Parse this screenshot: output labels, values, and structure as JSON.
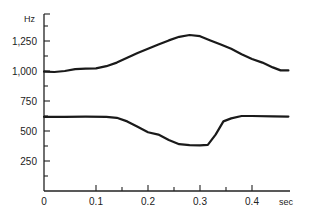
{
  "chart_data": {
    "type": "line",
    "title": "",
    "xlabel": "sec",
    "ylabel": "Hz",
    "xlim": [
      0,
      0.47
    ],
    "ylim": [
      0,
      1450
    ],
    "grid": false,
    "legend": "none",
    "x_ticks": [
      {
        "value": 0,
        "label": "0"
      },
      {
        "value": 0.1,
        "label": "0.1"
      },
      {
        "value": 0.2,
        "label": "0.2"
      },
      {
        "value": 0.3,
        "label": "0.3"
      },
      {
        "value": 0.4,
        "label": "0.4"
      }
    ],
    "x_minor_ticks": [
      0.15,
      0.25,
      0.35
    ],
    "y_ticks": [
      {
        "value": 250,
        "label": "250"
      },
      {
        "value": 500,
        "label": "500"
      },
      {
        "value": 750,
        "label": "750"
      },
      {
        "value": 1000,
        "label": "1,000"
      },
      {
        "value": 1250,
        "label": "1,250"
      }
    ],
    "y_minor_ticks": [
      125,
      375,
      625,
      875,
      1125,
      1375
    ],
    "series": [
      {
        "name": "upper formant",
        "points": [
          [
            0.0,
            995
          ],
          [
            0.02,
            992
          ],
          [
            0.04,
            1000
          ],
          [
            0.06,
            1015
          ],
          [
            0.08,
            1020
          ],
          [
            0.1,
            1022
          ],
          [
            0.12,
            1040
          ],
          [
            0.14,
            1070
          ],
          [
            0.16,
            1110
          ],
          [
            0.18,
            1150
          ],
          [
            0.2,
            1185
          ],
          [
            0.22,
            1220
          ],
          [
            0.24,
            1255
          ],
          [
            0.26,
            1285
          ],
          [
            0.28,
            1300
          ],
          [
            0.3,
            1290
          ],
          [
            0.32,
            1255
          ],
          [
            0.34,
            1220
          ],
          [
            0.36,
            1185
          ],
          [
            0.38,
            1140
          ],
          [
            0.4,
            1100
          ],
          [
            0.42,
            1070
          ],
          [
            0.44,
            1030
          ],
          [
            0.455,
            1005
          ],
          [
            0.47,
            1005
          ]
        ]
      },
      {
        "name": "lower formant",
        "points": [
          [
            0.0,
            618
          ],
          [
            0.04,
            618
          ],
          [
            0.08,
            620
          ],
          [
            0.12,
            618
          ],
          [
            0.14,
            610
          ],
          [
            0.16,
            580
          ],
          [
            0.18,
            535
          ],
          [
            0.2,
            490
          ],
          [
            0.22,
            470
          ],
          [
            0.24,
            425
          ],
          [
            0.26,
            390
          ],
          [
            0.28,
            382
          ],
          [
            0.3,
            380
          ],
          [
            0.315,
            385
          ],
          [
            0.33,
            470
          ],
          [
            0.345,
            580
          ],
          [
            0.36,
            605
          ],
          [
            0.38,
            625
          ],
          [
            0.4,
            625
          ],
          [
            0.44,
            622
          ],
          [
            0.47,
            620
          ]
        ]
      }
    ]
  }
}
